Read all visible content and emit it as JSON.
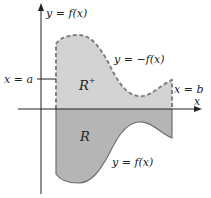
{
  "diagram": {
    "axes": {
      "x_label": "x",
      "y_label": "y = f(x)"
    },
    "curves": {
      "upper_label": "y = −f(x)",
      "upper_style": "dashed",
      "lower_label": "y = f(x)",
      "lower_style": "solid"
    },
    "bounds": {
      "left_label": "x = a",
      "right_label": "x = b"
    },
    "regions": {
      "upper": {
        "label": "R",
        "superscript": "+",
        "fill": "#d3d3d3"
      },
      "lower": {
        "label": "R",
        "superscript": "",
        "fill": "#b5b5b5"
      }
    },
    "colors": {
      "axis": "#222222",
      "curve": "#6e6e6e",
      "dashed_curve": "#808080"
    }
  }
}
